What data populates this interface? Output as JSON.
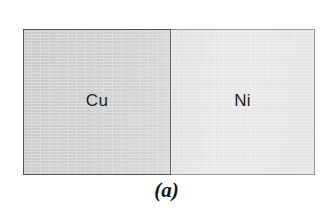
{
  "figure": {
    "caption": "(a)",
    "background_color": "#ffffff",
    "diagram": {
      "name": "diffusion-couple",
      "border_color": "#555555",
      "blocks": [
        {
          "id": "cu",
          "label": "Cu",
          "element_name": "copper",
          "fill_color": "#cdcdcd",
          "border_color": "#555555",
          "label_color": "#1d1d1d",
          "position": "left"
        },
        {
          "id": "ni",
          "label": "Ni",
          "element_name": "nickel",
          "fill_color": "#e9e9e9",
          "border_color": "#9b9b9b",
          "label_color": "#1d1d1d",
          "position": "right"
        }
      ]
    }
  }
}
